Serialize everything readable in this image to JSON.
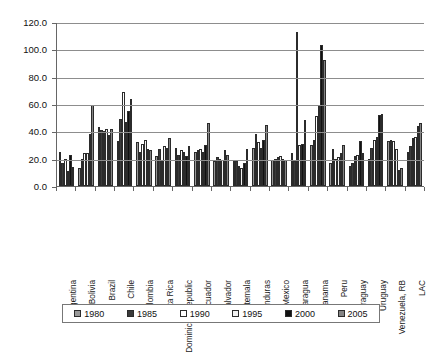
{
  "chart_data": {
    "type": "bar",
    "title": "",
    "xlabel": "",
    "ylabel": "",
    "ylim": [
      0,
      120
    ],
    "ytick_labels": [
      "0.0",
      "20.0",
      "40.0",
      "60.0",
      "80.0",
      "100.0",
      "120.0"
    ],
    "ytick_values": [
      0,
      20,
      40,
      60,
      80,
      100,
      120
    ],
    "grid": true,
    "legend_position": "bottom",
    "categories": [
      "Argentina",
      "Bolivia",
      "Brazil",
      "Chile",
      "Colombia",
      "Costa Rica",
      "Dominican Republic",
      "Ecuador",
      "El Salvador",
      "Guatemala",
      "Honduras",
      "Mexico",
      "Nicaragua",
      "Panama",
      "Peru",
      "Paraguay",
      "Uruguay",
      "Venezuela, RB",
      "LAC"
    ],
    "series": [
      {
        "name": "1980",
        "color": "#999999",
        "values": [
          25.0,
          13.0,
          43.0,
          33.0,
          32.0,
          22.0,
          28.0,
          25.0,
          18.0,
          19.0,
          28.0,
          19.0,
          24.0,
          30.0,
          17.0,
          15.0,
          20.0,
          33.0,
          25.0
        ]
      },
      {
        "name": "1985",
        "color": "#3a3a3a",
        "values": [
          17.0,
          20.0,
          41.0,
          49.0,
          25.0,
          27.0,
          23.0,
          26.0,
          21.0,
          18.0,
          38.0,
          20.0,
          18.0,
          34.0,
          27.0,
          17.0,
          28.0,
          34.0,
          29.0
        ]
      },
      {
        "name": "1990",
        "color": "#ffffff",
        "values": [
          20.0,
          24.0,
          40.0,
          69.0,
          31.0,
          19.0,
          26.0,
          27.0,
          20.0,
          15.0,
          32.0,
          21.0,
          113.0,
          51.0,
          20.0,
          22.0,
          34.0,
          33.0,
          35.0
        ]
      },
      {
        "name": "1995",
        "color": "#f2f2f2",
        "values": [
          11.0,
          24.0,
          42.0,
          47.0,
          34.0,
          29.0,
          25.0,
          25.0,
          19.0,
          13.0,
          28.0,
          22.0,
          30.0,
          59.0,
          21.0,
          23.0,
          36.0,
          27.0,
          36.0
        ]
      },
      {
        "name": "2000",
        "color": "#111111",
        "values": [
          23.0,
          38.0,
          37.0,
          55.0,
          27.0,
          28.0,
          22.0,
          30.0,
          26.0,
          17.0,
          34.0,
          20.0,
          31.0,
          103.0,
          24.0,
          33.0,
          52.0,
          12.0,
          44.0
        ]
      },
      {
        "name": "2005",
        "color": "#848484",
        "values": [
          14.0,
          59.0,
          42.0,
          64.0,
          26.0,
          35.0,
          29.0,
          46.0,
          23.0,
          27.0,
          45.0,
          19.0,
          48.0,
          92.0,
          30.0,
          24.0,
          53.0,
          13.0,
          46.0
        ]
      }
    ]
  },
  "legend": {
    "items": [
      {
        "label": "1980",
        "swatch": "legend-swatch-1980"
      },
      {
        "label": "1985",
        "swatch": "legend-swatch-1985"
      },
      {
        "label": "1990",
        "swatch": "legend-swatch-1990"
      },
      {
        "label": "1995",
        "swatch": "legend-swatch-1995"
      },
      {
        "label": "2000",
        "swatch": "legend-swatch-2000"
      },
      {
        "label": "2005",
        "swatch": "legend-swatch-2005"
      }
    ]
  }
}
